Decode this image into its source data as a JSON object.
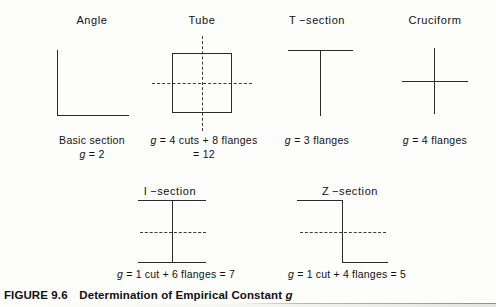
{
  "figure": {
    "label": "FIGURE 9.6",
    "title": "Determination of Empirical Constant g",
    "full_caption": "FIGURE 9.6  Determination of Empirical Constant g"
  },
  "row1": {
    "items": [
      {
        "name": "angle",
        "heading": "Angle",
        "caption_line1": "Basic section",
        "caption_line2": "g = 2",
        "shape": "L-shape: vertical leg and horizontal leg meeting at bottom-left corner"
      },
      {
        "name": "tube",
        "heading": "Tube",
        "caption_line1": "g = 4 cuts + 8 flanges",
        "caption_line2": "= 12",
        "shape": "closed square with horizontal and vertical dashed centerlines"
      },
      {
        "name": "t-section",
        "heading": "T −section",
        "caption_line1": "g = 3 flanges",
        "caption_line2": "",
        "shape": "horizontal top flange with vertical web descending from its center"
      },
      {
        "name": "cruciform",
        "heading": "Cruciform",
        "caption_line1": "g = 4 flanges",
        "caption_line2": "",
        "shape": "vertical line crossed by horizontal line forming a plus"
      }
    ]
  },
  "row2": {
    "items": [
      {
        "name": "i-section",
        "heading": "I −section",
        "caption": "g = 1 cut + 6 flanges = 7",
        "shape": "top flange, bottom flange, central vertical web, dashed horizontal centerline"
      },
      {
        "name": "z-section",
        "heading": "Z −section",
        "caption": "g = 1 cut + 4 flanges = 5",
        "shape": "top flange extending left, vertical web, bottom flange extending right, dashed horizontal centerline"
      }
    ]
  },
  "colors": {
    "ink": "#2b2b2b",
    "dashed": "#3a3a3a",
    "background": "#fdfdfc",
    "rule": "#8f8f8f"
  }
}
